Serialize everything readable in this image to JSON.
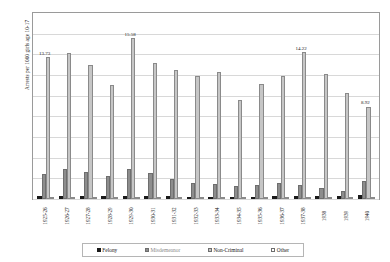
{
  "chart_data": {
    "type": "bar",
    "title": "",
    "xlabel": "",
    "ylabel": "Arrests per 1000 girls age 10-17",
    "ylim": [
      0,
      18
    ],
    "ytick_step": 2,
    "ytick_labels": [
      "18.00",
      "16.00",
      "14.00",
      "12.00",
      "10.00",
      "8.00",
      "6.00",
      "4.00",
      "2.00",
      "0.00"
    ],
    "grid": true,
    "legend_position": "bottom",
    "categories": [
      "1925-26",
      "1926-27",
      "1927-28",
      "1928-29",
      "1929-30",
      "1930-31",
      "1931-32",
      "1932-33",
      "1933-34",
      "1934-35",
      "1935-36",
      "1936-37",
      "1937-38",
      "1938",
      "1939",
      "1940"
    ],
    "series": [
      {
        "name": "Felony",
        "color": "#1a1a1a",
        "values": [
          0.3,
          0.34,
          0.3,
          0.28,
          0.34,
          0.32,
          0.26,
          0.24,
          0.22,
          0.22,
          0.24,
          0.26,
          0.28,
          0.3,
          0.26,
          0.38
        ]
      },
      {
        "name": "Misdemeanor",
        "color": "#8d8d8d",
        "values": [
          2.45,
          2.95,
          2.6,
          2.2,
          2.95,
          2.55,
          1.95,
          1.55,
          1.45,
          1.3,
          1.35,
          1.55,
          1.4,
          1.05,
          0.8,
          1.75
        ]
      },
      {
        "name": "Non-Criminal",
        "color": "#c6c6c6",
        "values": [
          13.73,
          14.1,
          13.0,
          11.0,
          15.58,
          13.2,
          12.45,
          11.95,
          12.3,
          9.55,
          11.1,
          11.95,
          14.22,
          12.1,
          10.3,
          8.92
        ]
      },
      {
        "name": "Other",
        "color": "#ffffff",
        "values": [
          0.1,
          0.12,
          0.1,
          0.1,
          0.12,
          0.1,
          0.1,
          0.1,
          0.08,
          0.08,
          0.08,
          0.08,
          0.1,
          0.1,
          0.08,
          0.1
        ]
      }
    ],
    "data_labels": [
      {
        "category": "1925-26",
        "series": "Non-Criminal",
        "text": "13.73"
      },
      {
        "category": "1929-30",
        "series": "Non-Criminal",
        "text": "15.58"
      },
      {
        "category": "1937-38",
        "series": "Non-Criminal",
        "text": "14.22"
      },
      {
        "category": "1940",
        "series": "Non-Criminal",
        "text": "8.92"
      }
    ]
  }
}
